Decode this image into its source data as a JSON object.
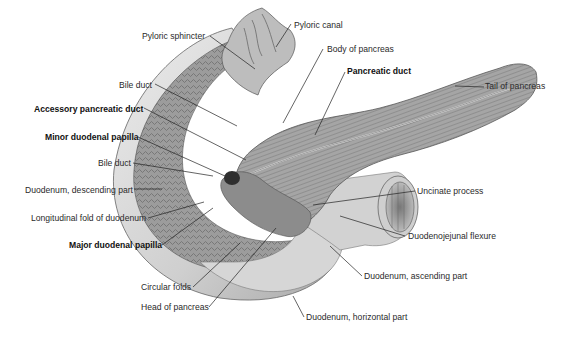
{
  "figure": {
    "labels": {
      "pyloric_sphincter": "Pyloric sphincter",
      "pyloric_canal": "Pyloric canal",
      "body_of_pancreas": "Body of pancreas",
      "pancreatic_duct": "Pancreatic duct",
      "tail_of_pancreas": "Tail of pancreas",
      "bile_duct_upper": "Bile duct",
      "accessory_pancreatic_duct": "Accessory pancreatic duct",
      "minor_duodenal_papilla": "Minor duodenal papilla",
      "bile_duct_lower": "Bile duct",
      "duodenum_descending": "Duodenum, descending part",
      "longitudinal_fold": "Longitudinal fold of duodenum",
      "major_duodenal_papilla": "Major duodenal papilla",
      "circular_folds": "Circular folds",
      "head_of_pancreas": "Head of pancreas",
      "uncinate_process": "Uncinate process",
      "duodenojejunal_flexure": "Duodenojejunal flexure",
      "duodenum_ascending": "Duodenum, ascending part",
      "duodenum_horizontal": "Duodenum, horizontal part"
    },
    "emphasized_labels": [
      "Pancreatic duct",
      "Accessory pancreatic duct",
      "Minor duodenal papilla",
      "Major duodenal papilla"
    ],
    "colors": {
      "background": "#ffffff",
      "tissue_light": "#d9d9d9",
      "tissue_mid": "#a8a8a8",
      "tissue_dark": "#555555",
      "leader_line": "#222222"
    }
  }
}
